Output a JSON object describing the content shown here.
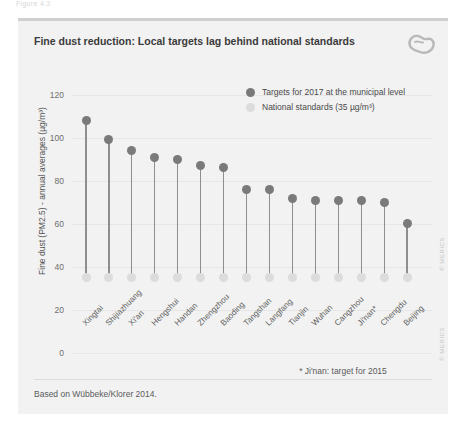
{
  "figure_caption": "Figure 4.3",
  "card": {
    "title": "Fine dust reduction: Local targets lag behind national standards",
    "logo_name": "merics-logo",
    "footnote": "* Ji'nan: target for 2015",
    "source": "Based on Wübbeke/Klorer 2014.",
    "watermark": "© MERICS"
  },
  "colors": {
    "card_background": "#f2f2f2",
    "target_dot": "#7a7a7a",
    "standard_dot": "#dcdcdc",
    "stem": "#8e8e8e",
    "gridline": "#e6e6e6",
    "title_text": "#3b3b3b",
    "axis_text": "#6e6e6e"
  },
  "chart_data": {
    "type": "scatter",
    "title": "Fine dust reduction: Local targets lag behind national standards",
    "subtitle": "",
    "xlabel": "",
    "ylabel": "Fine dust (PM2.5) - annual averages (µg/m³)",
    "ylim": [
      0,
      125
    ],
    "yticks": [
      0,
      20,
      40,
      60,
      80,
      100,
      120
    ],
    "grid": true,
    "legend_position": "inside-top-right",
    "annotations": [
      "* Ji'nan: target for 2015"
    ],
    "categories": [
      "Xingtai",
      "Shijiazhuang",
      "Xi'an",
      "Hengshui",
      "Handan",
      "Zhengzhou",
      "Baoding",
      "Tangshan",
      "Langfang",
      "Tianjin",
      "Wuhan",
      "Cangzhou",
      "Ji'nan*",
      "Chengdu",
      "Beijing"
    ],
    "series": [
      {
        "name": "Targets for 2017 at the municipal level",
        "color": "#7a7a7a",
        "values": [
          108,
          99,
          94,
          91,
          90,
          87,
          86,
          76,
          76,
          72,
          71,
          71,
          71,
          70,
          60
        ]
      },
      {
        "name": "National standards (35 µg/m³)",
        "color": "#dcdcdc",
        "values": [
          35,
          35,
          35,
          35,
          35,
          35,
          35,
          35,
          35,
          35,
          35,
          35,
          35,
          35,
          35
        ]
      }
    ]
  },
  "legend": [
    {
      "label": "Targets for 2017 at the municipal level",
      "color": "#7a7a7a"
    },
    {
      "label": "National standards (35 µg/m³)",
      "color": "#dcdcdc"
    }
  ]
}
